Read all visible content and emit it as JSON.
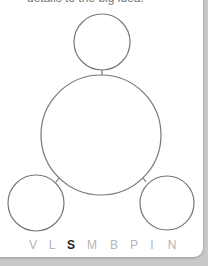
{
  "caption": "details to the big idea.",
  "diagram": {
    "stroke_color": "#777777",
    "circles": [
      {
        "id": "top",
        "cx": 102,
        "cy": 42,
        "r": 28
      },
      {
        "id": "center",
        "cx": 101,
        "cy": 135,
        "r": 60
      },
      {
        "id": "bottom-left",
        "cx": 36,
        "cy": 203,
        "r": 28
      },
      {
        "id": "bottom-right",
        "cx": 167,
        "cy": 203,
        "r": 27
      }
    ]
  },
  "letter_selector": {
    "items": [
      {
        "label": "V",
        "x": 33
      },
      {
        "label": "L",
        "x": 52
      },
      {
        "label": "S",
        "x": 71,
        "active": true
      },
      {
        "label": "M",
        "x": 92
      },
      {
        "label": "B",
        "x": 114
      },
      {
        "label": "P",
        "x": 134
      },
      {
        "label": "I",
        "x": 152
      },
      {
        "label": "N",
        "x": 172
      }
    ]
  }
}
